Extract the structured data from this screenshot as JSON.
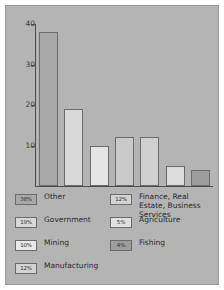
{
  "chart_data": {
    "type": "bar",
    "title": "",
    "subtitle": "",
    "xlabel": "",
    "ylabel": "",
    "ylim": [
      0,
      40
    ],
    "yticks": [
      10,
      20,
      30,
      40
    ],
    "ytick_labels": [
      "10",
      "20",
      "30",
      "40"
    ],
    "grid": false,
    "legend_position": "bottom",
    "categories": [
      "Other",
      "Government",
      "Manufacturing",
      "Finance, Real Estate, Business Services",
      "Mining",
      "Agriculture",
      "Fishing"
    ],
    "values": [
      38,
      19,
      10,
      12,
      12,
      5,
      4
    ],
    "bars": [
      {
        "name": "Other",
        "value": 38,
        "percent": "38%",
        "color": "#a9a9a9"
      },
      {
        "name": "Government",
        "value": 19,
        "percent": "19%",
        "color": "#d8d8d8"
      },
      {
        "name": "Manufacturing",
        "value": 10,
        "percent": "12%",
        "color": "#e4e4e4"
      },
      {
        "name": "Finance",
        "value": 12,
        "percent": "12%",
        "color": "#c9c9c9"
      },
      {
        "name": "Mining",
        "value": 12,
        "percent": "10%",
        "color": "#cfcfcf"
      },
      {
        "name": "Agriculture",
        "value": 5,
        "percent": "5%",
        "color": "#dcdcdc"
      },
      {
        "name": "Fishing",
        "value": 4,
        "percent": "4%",
        "color": "#9d9d9d"
      }
    ],
    "legend": {
      "left_column": [
        {
          "percent": "38%",
          "label": "Other",
          "color": "#a9a9a9"
        },
        {
          "percent": "19%",
          "label": "Government",
          "color": "#d8d8d8"
        },
        {
          "percent": "10%",
          "label": "Mining",
          "color": "#e8e8e8"
        },
        {
          "percent": "12%",
          "label": "Manufacturing",
          "color": "#d2d2d2"
        }
      ],
      "right_column": [
        {
          "percent": "12%",
          "label": "Finance, Real Estate, Business Services",
          "color": "#d2d2d2"
        },
        {
          "percent": "5%",
          "label": "Agriculture",
          "color": "#e0e0e0"
        },
        {
          "percent": "4%",
          "label": "Fishing",
          "color": "#9d9d9d"
        }
      ]
    },
    "colors": {
      "background": "#b4b4b4",
      "axis": "#4d4d4d",
      "bar_border": "#6b6b6b",
      "text": "#2b2b2b"
    }
  }
}
